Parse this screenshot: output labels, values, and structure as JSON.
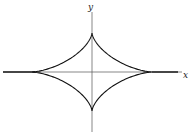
{
  "diagram": {
    "type": "astroid-curve",
    "axes": {
      "x_label": "x",
      "y_label": "y"
    },
    "curve": {
      "description": "Four-cusped curve (astroid-like) symmetric about both axes with cusps on the axes",
      "cusps": [
        "top",
        "right",
        "bottom",
        "left"
      ]
    },
    "colors": {
      "curve": "#111111",
      "axes": "#444444",
      "background": "#ffffff"
    }
  }
}
